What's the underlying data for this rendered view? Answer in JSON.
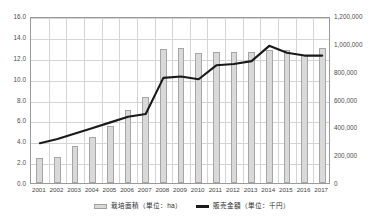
{
  "chart_data": {
    "type": "bar",
    "title": "",
    "xlabel": "",
    "ylabel": "",
    "grid": true,
    "legend_position": "bottom",
    "categories": [
      "2001",
      "2002",
      "2003",
      "2004",
      "2005",
      "2006",
      "2007",
      "2008",
      "2009",
      "2010",
      "2011",
      "2012",
      "2013",
      "2014",
      "2015",
      "2016",
      "2017"
    ],
    "axes": {
      "left": {
        "label": "栽培面積（単位：ha）",
        "min": 0.0,
        "max": 16.0,
        "step": 2.0,
        "ticks": [
          "0.0",
          "2.0",
          "4.0",
          "6.0",
          "8.0",
          "10.0",
          "12.0",
          "14.0",
          "16.0"
        ]
      },
      "right": {
        "label": "販売金額（単位：千円）",
        "min": 0,
        "max": 1200000,
        "step": 200000,
        "ticks": [
          "0",
          "200,000",
          "400,000",
          "600,000",
          "800,000",
          "1,000,000",
          "1,200,000"
        ]
      }
    },
    "series": [
      {
        "name": "栽培面積（単位：ha）",
        "type": "bar",
        "axis": "left",
        "unit": "ha",
        "color": "#d9d9d9",
        "edge_color": "#a6a6a6",
        "values": [
          2.4,
          2.5,
          3.5,
          4.4,
          5.5,
          7.0,
          8.2,
          12.8,
          12.9,
          12.5,
          12.6,
          12.6,
          12.6,
          12.7,
          12.7,
          12.3,
          12.9
        ]
      },
      {
        "name": "販売金額（単位：千円）",
        "type": "line",
        "axis": "right",
        "unit": "千円",
        "color": "#1a1a1a",
        "values": [
          300000,
          330000,
          370000,
          410000,
          450000,
          490000,
          510000,
          770000,
          780000,
          760000,
          860000,
          870000,
          890000,
          1000000,
          950000,
          930000,
          930000
        ]
      }
    ]
  },
  "legend": {
    "items": [
      {
        "label": "栽培面積（単位：ha）",
        "marker": "bar-swatch"
      },
      {
        "label": "販売金額（単位：千円）",
        "marker": "line-swatch"
      }
    ]
  }
}
